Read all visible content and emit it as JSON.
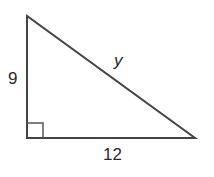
{
  "diagram": {
    "type": "right-triangle",
    "labels": {
      "vertical_leg": "9",
      "hypotenuse": "y",
      "horizontal_leg": "12"
    },
    "right_angle_marker": true,
    "colors": {
      "stroke": "#444444",
      "background": "#ffffff"
    }
  }
}
